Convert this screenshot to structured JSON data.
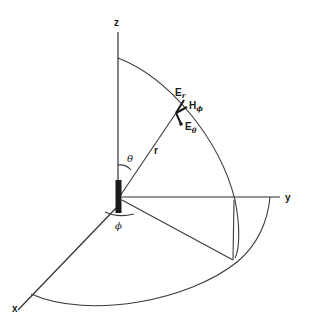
{
  "figure": {
    "type": "spherical-coordinate-field-diagram",
    "axes": {
      "z": "z",
      "y": "y",
      "x": "x"
    },
    "labels": {
      "radius": "r",
      "theta": "θ",
      "phi": "ϕ",
      "e_r_main": "E",
      "e_r_sub": "r",
      "h_phi_main": "H",
      "h_phi_sub": "ϕ",
      "e_theta_main": "E",
      "e_theta_sub": "θ"
    },
    "colors": {
      "line": "#3a3a3a",
      "ink": "#1a1a1a",
      "background": "#ffffff"
    }
  }
}
